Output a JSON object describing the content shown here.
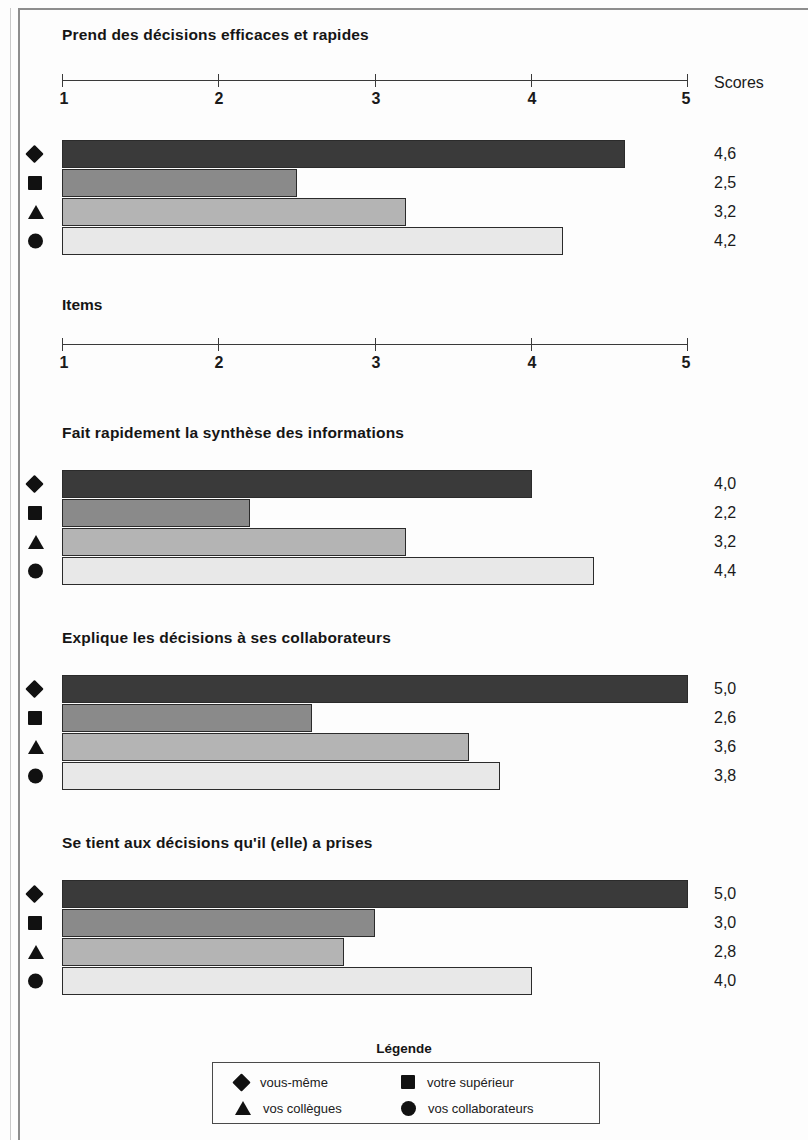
{
  "axis": {
    "tick_labels": [
      "1",
      "2",
      "3",
      "4",
      "5"
    ],
    "min": 1,
    "max": 5,
    "scores_header": "Scores",
    "items_label": "Items"
  },
  "legend": {
    "title": "Légende",
    "items": [
      {
        "marker": "diamond-marker",
        "label": "vous-même"
      },
      {
        "marker": "square-marker",
        "label": "votre supérieur"
      },
      {
        "marker": "triangle-marker",
        "label": "vos collègues"
      },
      {
        "marker": "circle-marker",
        "label": "vos collaborateurs"
      }
    ]
  },
  "colors": {
    "series_0": "#3a3a3a",
    "series_1": "#8a8a8a",
    "series_2": "#b4b4b4",
    "series_3": "#e8e8e8",
    "text": "#1a1a1a",
    "rule": "#3a3a3a"
  },
  "chart_data": [
    {
      "type": "bar",
      "orientation": "horizontal",
      "title": "Prend des décisions efficaces et rapides",
      "xlabel": "Scores",
      "ylabel": "Items",
      "xlim": [
        1,
        5
      ],
      "xticks": [
        1,
        2,
        3,
        4,
        5
      ],
      "grid": false,
      "legend_position": "bottom",
      "categories": [
        "vous-même",
        "votre supérieur",
        "vos collègues",
        "vos collaborateurs"
      ],
      "values": [
        4.6,
        2.5,
        3.2,
        4.2
      ],
      "value_labels": [
        "4,6",
        "2,5",
        "3,2",
        "4,2"
      ]
    },
    {
      "type": "bar",
      "orientation": "horizontal",
      "title": "Fait rapidement la synthèse des informations",
      "xlabel": "Scores",
      "ylabel": "Items",
      "xlim": [
        1,
        5
      ],
      "xticks": [
        1,
        2,
        3,
        4,
        5
      ],
      "grid": false,
      "legend_position": "bottom",
      "categories": [
        "vous-même",
        "votre supérieur",
        "vos collègues",
        "vos collaborateurs"
      ],
      "values": [
        4.0,
        2.2,
        3.2,
        4.4
      ],
      "value_labels": [
        "4,0",
        "2,2",
        "3,2",
        "4,4"
      ]
    },
    {
      "type": "bar",
      "orientation": "horizontal",
      "title": "Explique les décisions à ses collaborateurs",
      "xlabel": "Scores",
      "ylabel": "Items",
      "xlim": [
        1,
        5
      ],
      "xticks": [
        1,
        2,
        3,
        4,
        5
      ],
      "grid": false,
      "legend_position": "bottom",
      "categories": [
        "vous-même",
        "votre supérieur",
        "vos collègues",
        "vos collaborateurs"
      ],
      "values": [
        5.0,
        2.6,
        3.6,
        3.8
      ],
      "value_labels": [
        "5,0",
        "2,6",
        "3,6",
        "3,8"
      ]
    },
    {
      "type": "bar",
      "orientation": "horizontal",
      "title": "Se tient aux décisions qu'il (elle) a prises",
      "xlabel": "Scores",
      "ylabel": "Items",
      "xlim": [
        1,
        5
      ],
      "xticks": [
        1,
        2,
        3,
        4,
        5
      ],
      "grid": false,
      "legend_position": "bottom",
      "categories": [
        "vous-même",
        "votre supérieur",
        "vos collègues",
        "vos collaborateurs"
      ],
      "values": [
        5.0,
        3.0,
        2.8,
        4.0
      ],
      "value_labels": [
        "5,0",
        "3,0",
        "2,8",
        "4,0"
      ]
    }
  ]
}
